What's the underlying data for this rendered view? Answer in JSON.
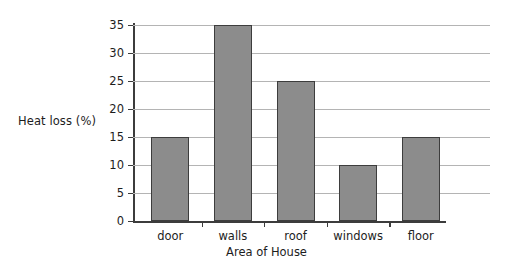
{
  "chart_data": {
    "type": "bar",
    "title": "",
    "categories": [
      "door",
      "walls",
      "roof",
      "windows",
      "floor"
    ],
    "values": [
      15,
      35,
      25,
      10,
      15
    ],
    "xlabel": "Area of House",
    "ylabel": "Heat loss (%)",
    "ylim": [
      0,
      35
    ],
    "yticks": [
      0,
      5,
      10,
      15,
      20,
      25,
      30,
      35
    ],
    "ytick_labels": [
      "0",
      "5",
      "10",
      "15",
      "20",
      "25",
      "30",
      "35"
    ],
    "grid": true,
    "legend": false,
    "legend_position": "none",
    "bar_fill_color": "#8c8c8c",
    "bar_edge_color": "#3d3d3d",
    "gridline_color": "#b4b4b4",
    "axis_color": "#3c3c3c",
    "background_color": "#ffffff"
  }
}
